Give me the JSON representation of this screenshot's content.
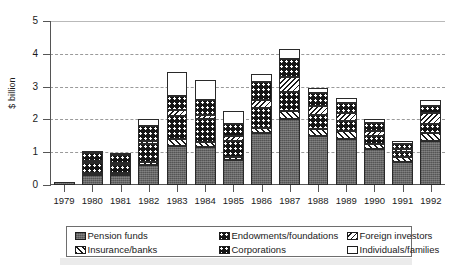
{
  "chart": {
    "ylabel": "$ billion",
    "y_ticks": [
      "0",
      "1",
      "2",
      "3",
      "4",
      "5"
    ],
    "x_ticks": [
      "1979",
      "1980",
      "1981",
      "1982",
      "1983",
      "1984",
      "1985",
      "1986",
      "1987",
      "1988",
      "1989",
      "1990",
      "1991",
      "1992"
    ]
  },
  "legend": {
    "items": [
      {
        "label": "Pension funds",
        "key": "pension",
        "pattern": "p-pension"
      },
      {
        "label": "Endowments/foundations",
        "key": "endowments",
        "pattern": "p-endow"
      },
      {
        "label": "Foreign investors",
        "key": "foreign",
        "pattern": "p-foreign"
      },
      {
        "label": "Insurance/banks",
        "key": "insurance",
        "pattern": "p-insurance"
      },
      {
        "label": "Corporations",
        "key": "corporations",
        "pattern": "p-corp"
      },
      {
        "label": "Individuals/families",
        "key": "individuals",
        "pattern": "p-indiv"
      }
    ]
  },
  "chart_data": {
    "type": "bar",
    "subtype": "stacked",
    "title": "",
    "xlabel": "",
    "ylabel": "$ billion",
    "ylim": [
      0,
      5
    ],
    "yticks": [
      0,
      1,
      2,
      3,
      4,
      5
    ],
    "grid": "horizontal-dashed",
    "legend_position": "bottom",
    "categories": [
      "1979",
      "1980",
      "1981",
      "1982",
      "1983",
      "1984",
      "1985",
      "1986",
      "1987",
      "1988",
      "1989",
      "1990",
      "1991",
      "1992"
    ],
    "series": [
      {
        "name": "Pension funds",
        "values": [
          0.1,
          0.3,
          0.3,
          0.6,
          1.2,
          1.15,
          0.75,
          1.6,
          2.0,
          1.5,
          1.4,
          1.1,
          0.7,
          1.35
        ]
      },
      {
        "name": "Insurance/banks",
        "values": [
          0.0,
          0.05,
          0.05,
          0.1,
          0.2,
          0.15,
          0.1,
          0.15,
          0.25,
          0.2,
          0.25,
          0.15,
          0.15,
          0.25
        ]
      },
      {
        "name": "Corporations",
        "values": [
          0.0,
          0.3,
          0.25,
          0.55,
          0.7,
          0.7,
          0.5,
          0.6,
          0.6,
          0.45,
          0.3,
          0.25,
          0.15,
          0.25
        ]
      },
      {
        "name": "Foreign investors",
        "values": [
          0.0,
          0.05,
          0.05,
          0.1,
          0.2,
          0.15,
          0.15,
          0.25,
          0.45,
          0.25,
          0.25,
          0.15,
          0.1,
          0.35
        ]
      },
      {
        "name": "Endowments/foundations",
        "values": [
          0.0,
          0.25,
          0.25,
          0.45,
          0.4,
          0.45,
          0.35,
          0.55,
          0.55,
          0.4,
          0.3,
          0.25,
          0.15,
          0.2
        ]
      },
      {
        "name": "Individuals/families",
        "values": [
          0.0,
          0.05,
          0.05,
          0.2,
          0.75,
          0.6,
          0.4,
          0.25,
          0.3,
          0.15,
          0.15,
          0.1,
          0.1,
          0.2
        ]
      }
    ],
    "totals": [
      0.1,
      1.0,
      0.95,
      2.0,
      3.45,
      3.2,
      2.25,
      3.4,
      4.15,
      2.95,
      2.65,
      2.0,
      1.35,
      2.6
    ]
  }
}
